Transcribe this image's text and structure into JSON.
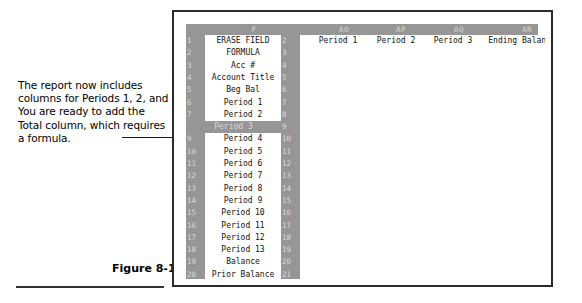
{
  "caption": {
    "lines": [
      "The report now includes",
      "columns for Periods 1, 2, and 3.",
      "You are ready to add the",
      "Total column, which requires",
      "a formula."
    ]
  },
  "figure": {
    "label": "Figure 8-17"
  },
  "spreadsheet": {
    "column_letters": [
      {
        "label": "F",
        "left": 38,
        "width": 60
      },
      {
        "label": "AO",
        "left": 133,
        "width": 50
      },
      {
        "label": "AP",
        "left": 190,
        "width": 50
      },
      {
        "label": "AQ",
        "left": 248,
        "width": 50
      },
      {
        "label": "AR",
        "left": 305,
        "width": 72
      }
    ],
    "left_row_numbers": [
      "1",
      "2",
      "3",
      "4",
      "5",
      "6",
      "7",
      "8",
      "9",
      "10",
      "11",
      "12",
      "13",
      "14",
      "15",
      "16",
      "17",
      "18",
      "19",
      "20"
    ],
    "right_row_numbers": [
      "2",
      "3",
      "4",
      "5",
      "6",
      "7",
      "8",
      "9",
      "10",
      "11",
      "12",
      "13",
      "14",
      "15",
      "16",
      "17",
      "18",
      "19",
      "20",
      "21"
    ],
    "field_names": [
      "ERASE FIELD",
      "FORMULA",
      "Acc #",
      "Account Title",
      "Beg Bal",
      "Period 1",
      "Period 2",
      "Period 3",
      "Period 4",
      "Period 5",
      "Period 6",
      "Period 7",
      "Period 8",
      "Period 9",
      "Period 10",
      "Period 11",
      "Period 12",
      "Period 13",
      "Balance",
      "Prior Balance"
    ],
    "selected_row_index": 7,
    "period_headers": [
      {
        "label": "Period 1",
        "left": 126,
        "width": 64
      },
      {
        "label": "Period 2",
        "left": 184,
        "width": 64
      },
      {
        "label": "Period 3",
        "left": 241,
        "width": 64
      },
      {
        "label": "Ending Balance",
        "left": 292,
        "width": 100
      }
    ]
  },
  "colors": {
    "header_gray": "#969696",
    "header_text": "#d8d8d8",
    "cell_text": "#111111",
    "frame": "#2b2b2b",
    "leader": "#1a1a1a"
  }
}
